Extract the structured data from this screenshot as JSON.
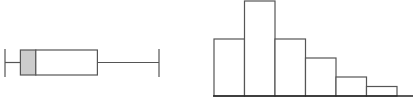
{
  "chart_data": [
    {
      "type": "boxplot",
      "title": "",
      "xlabel": "",
      "ylabel": "",
      "orientation": "horizontal",
      "grid": false,
      "whisker_min": 0,
      "q1": 1,
      "median": 2,
      "q3": 6,
      "whisker_max": 10,
      "shaded_segment": "q1-median",
      "colors": {
        "stroke": "#555555",
        "shade": "#cccccc",
        "fill": "#ffffff"
      }
    },
    {
      "type": "bar",
      "subtype": "histogram",
      "title": "",
      "xlabel": "",
      "ylabel": "",
      "grid": false,
      "categories": [
        "bin1",
        "bin2",
        "bin3",
        "bin4",
        "bin5",
        "bin6"
      ],
      "values": [
        6,
        10,
        6,
        4,
        2,
        1
      ],
      "ylim": [
        0,
        10
      ],
      "colors": {
        "stroke": "#555555",
        "fill": "#ffffff",
        "axis": "#222222"
      }
    }
  ]
}
